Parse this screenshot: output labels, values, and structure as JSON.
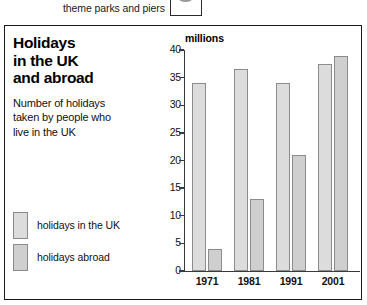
{
  "worksheet": {
    "question_text": "theme parks and piers",
    "answer_box_name": "answer-box"
  },
  "panel": {
    "title": "Holidays\nin the UK\nand abroad",
    "subtitle": "Number of holidays\ntaken by people who\nlive in the UK"
  },
  "legend": {
    "items": [
      {
        "label": "holidays in the UK",
        "color": "#dcdcdc"
      },
      {
        "label": "holidays abroad",
        "color": "#cfcfcf"
      }
    ]
  },
  "chart_data": {
    "type": "bar",
    "title": "Holidays in the UK and abroad",
    "subtitle": "Number of holidays taken by people who live in the UK",
    "xlabel": "",
    "ylabel": "millions",
    "unit_label": "millions",
    "categories": [
      "1971",
      "1981",
      "1991",
      "2001"
    ],
    "series": [
      {
        "name": "holidays in the UK",
        "color": "#dcdcdc",
        "values": [
          34,
          36.5,
          34,
          37.5
        ]
      },
      {
        "name": "holidays abroad",
        "color": "#cfcfcf",
        "values": [
          4,
          13,
          21,
          39
        ]
      }
    ],
    "ylim": [
      0,
      40
    ],
    "yticks": [
      0,
      5,
      10,
      15,
      20,
      25,
      30,
      35,
      40
    ],
    "ytick_labels": [
      "0",
      "5",
      "10",
      "15",
      "20",
      "25",
      "30",
      "35",
      "40"
    ],
    "grid": false,
    "legend_position": "left"
  }
}
